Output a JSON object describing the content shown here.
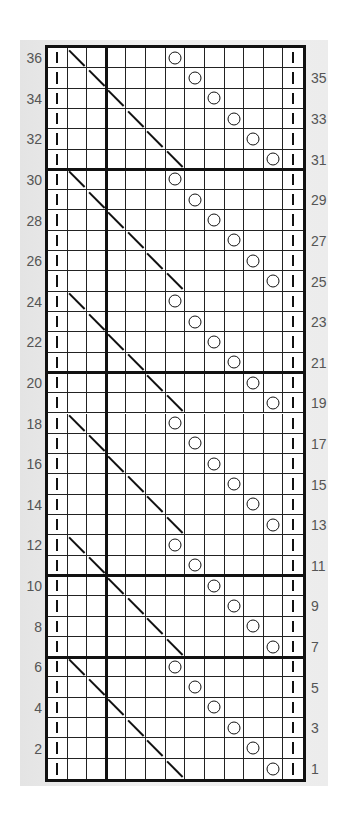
{
  "chart": {
    "type": "knitting-chart",
    "columns": 13,
    "rows": 36,
    "legend_symbols": {
      "purl": "vertical bar |",
      "k2tog": "diagonal \\",
      "yo": "circle O",
      "knit": "blank"
    },
    "heavy_horizontal_after_rows": [
      30,
      20,
      10,
      6
    ],
    "heavy_vertical_after_col": 3,
    "left_row_labels": [
      "36",
      "34",
      "32",
      "30",
      "28",
      "26",
      "24",
      "22",
      "20",
      "18",
      "16",
      "14",
      "12",
      "10",
      "8",
      "6",
      "4",
      "2"
    ],
    "right_row_labels": [
      "35",
      "33",
      "31",
      "29",
      "27",
      "25",
      "23",
      "21",
      "19",
      "17",
      "15",
      "13",
      "11",
      "9",
      "7",
      "5",
      "3",
      "1"
    ],
    "grid": [
      {
        "row": 36,
        "cells": [
          "|",
          "\\",
          "",
          "",
          "",
          "",
          "O",
          "",
          "",
          "",
          "",
          "",
          "|"
        ]
      },
      {
        "row": 35,
        "cells": [
          "|",
          "",
          "\\",
          "",
          "",
          "",
          "",
          "O",
          "",
          "",
          "",
          "",
          "|"
        ]
      },
      {
        "row": 34,
        "cells": [
          "|",
          "",
          "",
          "\\",
          "",
          "",
          "",
          "",
          "O",
          "",
          "",
          "",
          "|"
        ]
      },
      {
        "row": 33,
        "cells": [
          "|",
          "",
          "",
          "",
          "\\",
          "",
          "",
          "",
          "",
          "O",
          "",
          "",
          "|"
        ]
      },
      {
        "row": 32,
        "cells": [
          "|",
          "",
          "",
          "",
          "",
          "\\",
          "",
          "",
          "",
          "",
          "O",
          "",
          "|"
        ]
      },
      {
        "row": 31,
        "cells": [
          "|",
          "",
          "",
          "",
          "",
          "",
          "\\",
          "",
          "",
          "",
          "",
          "O",
          "|"
        ]
      },
      {
        "row": 30,
        "cells": [
          "|",
          "\\",
          "",
          "",
          "",
          "",
          "O",
          "",
          "",
          "",
          "",
          "",
          "|"
        ]
      },
      {
        "row": 29,
        "cells": [
          "|",
          "",
          "\\",
          "",
          "",
          "",
          "",
          "O",
          "",
          "",
          "",
          "",
          "|"
        ]
      },
      {
        "row": 28,
        "cells": [
          "|",
          "",
          "",
          "\\",
          "",
          "",
          "",
          "",
          "O",
          "",
          "",
          "",
          "|"
        ]
      },
      {
        "row": 27,
        "cells": [
          "|",
          "",
          "",
          "",
          "\\",
          "",
          "",
          "",
          "",
          "O",
          "",
          "",
          "|"
        ]
      },
      {
        "row": 26,
        "cells": [
          "|",
          "",
          "",
          "",
          "",
          "\\",
          "",
          "",
          "",
          "",
          "O",
          "",
          "|"
        ]
      },
      {
        "row": 25,
        "cells": [
          "|",
          "",
          "",
          "",
          "",
          "",
          "\\",
          "",
          "",
          "",
          "",
          "O",
          "|"
        ]
      },
      {
        "row": 24,
        "cells": [
          "|",
          "\\",
          "",
          "",
          "",
          "",
          "O",
          "",
          "",
          "",
          "",
          "",
          "|"
        ]
      },
      {
        "row": 23,
        "cells": [
          "|",
          "",
          "\\",
          "",
          "",
          "",
          "",
          "O",
          "",
          "",
          "",
          "",
          "|"
        ]
      },
      {
        "row": 22,
        "cells": [
          "|",
          "",
          "",
          "\\",
          "",
          "",
          "",
          "",
          "O",
          "",
          "",
          "",
          "|"
        ]
      },
      {
        "row": 21,
        "cells": [
          "|",
          "",
          "",
          "",
          "\\",
          "",
          "",
          "",
          "",
          "O",
          "",
          "",
          "|"
        ]
      },
      {
        "row": 20,
        "cells": [
          "|",
          "",
          "",
          "",
          "",
          "\\",
          "",
          "",
          "",
          "",
          "O",
          "",
          "|"
        ]
      },
      {
        "row": 19,
        "cells": [
          "|",
          "",
          "",
          "",
          "",
          "",
          "\\",
          "",
          "",
          "",
          "",
          "O",
          "|"
        ]
      },
      {
        "row": 18,
        "cells": [
          "|",
          "\\",
          "",
          "",
          "",
          "",
          "O",
          "",
          "",
          "",
          "",
          "",
          "|"
        ]
      },
      {
        "row": 17,
        "cells": [
          "|",
          "",
          "\\",
          "",
          "",
          "",
          "",
          "O",
          "",
          "",
          "",
          "",
          "|"
        ]
      },
      {
        "row": 16,
        "cells": [
          "|",
          "",
          "",
          "\\",
          "",
          "",
          "",
          "",
          "O",
          "",
          "",
          "",
          "|"
        ]
      },
      {
        "row": 15,
        "cells": [
          "|",
          "",
          "",
          "",
          "\\",
          "",
          "",
          "",
          "",
          "O",
          "",
          "",
          "|"
        ]
      },
      {
        "row": 14,
        "cells": [
          "|",
          "",
          "",
          "",
          "",
          "\\",
          "",
          "",
          "",
          "",
          "O",
          "",
          "|"
        ]
      },
      {
        "row": 13,
        "cells": [
          "|",
          "",
          "",
          "",
          "",
          "",
          "\\",
          "",
          "",
          "",
          "",
          "O",
          "|"
        ]
      },
      {
        "row": 12,
        "cells": [
          "|",
          "\\",
          "",
          "",
          "",
          "",
          "O",
          "",
          "",
          "",
          "",
          "",
          "|"
        ]
      },
      {
        "row": 11,
        "cells": [
          "|",
          "",
          "\\",
          "",
          "",
          "",
          "",
          "O",
          "",
          "",
          "",
          "",
          "|"
        ]
      },
      {
        "row": 10,
        "cells": [
          "|",
          "",
          "",
          "\\",
          "",
          "",
          "",
          "",
          "O",
          "",
          "",
          "",
          "|"
        ]
      },
      {
        "row": 9,
        "cells": [
          "|",
          "",
          "",
          "",
          "\\",
          "",
          "",
          "",
          "",
          "O",
          "",
          "",
          "|"
        ]
      },
      {
        "row": 8,
        "cells": [
          "|",
          "",
          "",
          "",
          "",
          "\\",
          "",
          "",
          "",
          "",
          "O",
          "",
          "|"
        ]
      },
      {
        "row": 7,
        "cells": [
          "|",
          "",
          "",
          "",
          "",
          "",
          "\\",
          "",
          "",
          "",
          "",
          "O",
          "|"
        ]
      },
      {
        "row": 6,
        "cells": [
          "|",
          "\\",
          "",
          "",
          "",
          "",
          "O",
          "",
          "",
          "",
          "",
          "",
          "|"
        ]
      },
      {
        "row": 5,
        "cells": [
          "|",
          "",
          "\\",
          "",
          "",
          "",
          "",
          "O",
          "",
          "",
          "",
          "",
          "|"
        ]
      },
      {
        "row": 4,
        "cells": [
          "|",
          "",
          "",
          "\\",
          "",
          "",
          "",
          "",
          "O",
          "",
          "",
          "",
          "|"
        ]
      },
      {
        "row": 3,
        "cells": [
          "|",
          "",
          "",
          "",
          "\\",
          "",
          "",
          "",
          "",
          "O",
          "",
          "",
          "|"
        ]
      },
      {
        "row": 2,
        "cells": [
          "|",
          "",
          "",
          "",
          "",
          "\\",
          "",
          "",
          "",
          "",
          "O",
          "",
          "|"
        ]
      },
      {
        "row": 1,
        "cells": [
          "|",
          "",
          "",
          "",
          "",
          "",
          "\\",
          "",
          "",
          "",
          "",
          "O",
          "|"
        ]
      }
    ]
  },
  "colors": {
    "grid_line": "#111111",
    "label_text": "#555555",
    "panel_bg": "#e8e8e8",
    "cell_bg": "#ffffff"
  }
}
